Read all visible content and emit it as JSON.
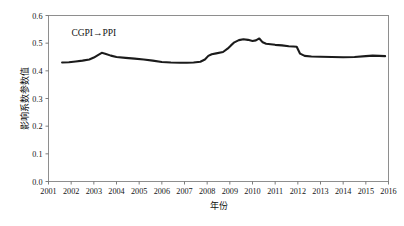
{
  "chart_data": {
    "type": "line",
    "title": "",
    "xlabel": "年份",
    "ylabel": "影响系数参数值",
    "xlim": [
      2001,
      2016
    ],
    "ylim": [
      0.0,
      0.6
    ],
    "grid": false,
    "legend_position": "inside-upper-left",
    "annotations": [
      {
        "text": "CGPI→PPI",
        "x": 2003.0,
        "y": 0.525
      }
    ],
    "xticks": [
      "2001",
      "2002",
      "2003",
      "2004",
      "2005",
      "2006",
      "2007",
      "2008",
      "2009",
      "2010",
      "2011",
      "2012",
      "2013",
      "2014",
      "2015",
      "2016"
    ],
    "yticks": [
      "0.0",
      "0.1",
      "0.2",
      "0.3",
      "0.4",
      "0.5",
      "0.6"
    ],
    "series": [
      {
        "name": "CGPI→PPI",
        "color": "#1b1b1b",
        "x": [
          2001.6,
          2001.9,
          2002.2,
          2002.5,
          2002.8,
          2003.0,
          2003.2,
          2003.35,
          2003.5,
          2003.75,
          2004.0,
          2004.4,
          2004.8,
          2005.2,
          2005.6,
          2006.0,
          2006.4,
          2006.8,
          2007.1,
          2007.4,
          2007.7,
          2007.9,
          2008.05,
          2008.2,
          2008.4,
          2008.7,
          2008.9,
          2009.05,
          2009.2,
          2009.4,
          2009.6,
          2009.8,
          2010.0,
          2010.15,
          2010.3,
          2010.45,
          2010.6,
          2010.8,
          2011.0,
          2011.3,
          2011.6,
          2011.8,
          2011.95,
          2012.1,
          2012.3,
          2012.6,
          2013.0,
          2013.5,
          2014.0,
          2014.5,
          2015.0,
          2015.3,
          2015.6,
          2015.85
        ],
        "y": [
          0.43,
          0.431,
          0.434,
          0.437,
          0.441,
          0.448,
          0.458,
          0.465,
          0.462,
          0.455,
          0.45,
          0.447,
          0.444,
          0.441,
          0.437,
          0.432,
          0.43,
          0.429,
          0.429,
          0.43,
          0.433,
          0.441,
          0.454,
          0.46,
          0.463,
          0.468,
          0.48,
          0.492,
          0.503,
          0.511,
          0.514,
          0.512,
          0.508,
          0.51,
          0.517,
          0.503,
          0.498,
          0.496,
          0.494,
          0.492,
          0.489,
          0.488,
          0.487,
          0.462,
          0.454,
          0.452,
          0.451,
          0.45,
          0.449,
          0.45,
          0.453,
          0.455,
          0.454,
          0.453
        ]
      }
    ]
  },
  "axes": {
    "y_label_text": "影响系数参数值",
    "x_label_text": "年份"
  }
}
